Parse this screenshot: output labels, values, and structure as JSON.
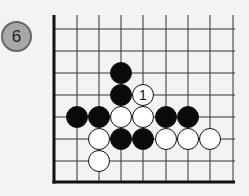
{
  "diagram": {
    "number": "6",
    "board": {
      "origin_x": 54,
      "origin_y": 182,
      "spacing": 22.2,
      "top_y": 15,
      "right_x": 235,
      "v_lines_x": [
        77,
        99,
        121,
        143,
        166,
        188,
        210,
        233
      ],
      "h_lines_y": [
        29,
        51,
        73,
        95,
        117,
        139,
        161
      ],
      "edge_left": true,
      "edge_bottom": true
    },
    "stones": [
      {
        "color": "black",
        "x": 121,
        "y": 73
      },
      {
        "color": "black",
        "x": 121,
        "y": 95
      },
      {
        "color": "white",
        "x": 143,
        "y": 95,
        "label": "1"
      },
      {
        "color": "black",
        "x": 77,
        "y": 117
      },
      {
        "color": "black",
        "x": 99,
        "y": 117
      },
      {
        "color": "white",
        "x": 121,
        "y": 117
      },
      {
        "color": "white",
        "x": 143,
        "y": 117
      },
      {
        "color": "black",
        "x": 166,
        "y": 117
      },
      {
        "color": "black",
        "x": 188,
        "y": 117
      },
      {
        "color": "white",
        "x": 99,
        "y": 139
      },
      {
        "color": "black",
        "x": 121,
        "y": 139
      },
      {
        "color": "black",
        "x": 143,
        "y": 139
      },
      {
        "color": "white",
        "x": 166,
        "y": 139
      },
      {
        "color": "white",
        "x": 188,
        "y": 139
      },
      {
        "color": "white",
        "x": 210,
        "y": 139
      },
      {
        "color": "white",
        "x": 99,
        "y": 161
      }
    ],
    "colors": {
      "black_stone": "#0a0a0a",
      "white_stone": "#ffffff",
      "grid": "#333333",
      "badge_fill": "#a8a8a8"
    }
  }
}
